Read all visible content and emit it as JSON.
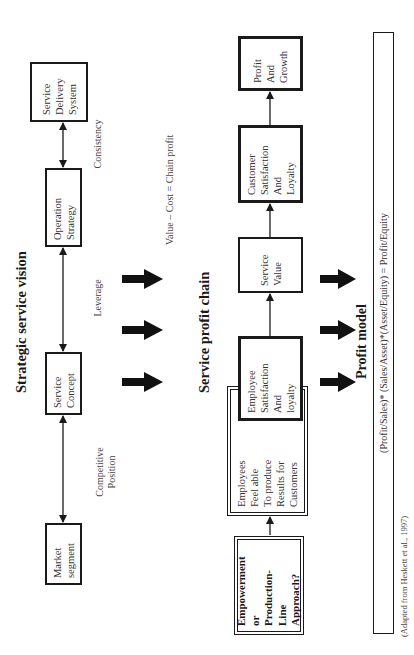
{
  "figure": {
    "strategic_vision": {
      "title": "Strategic service vision",
      "boxes": [
        {
          "lines": [
            "Market",
            "segment"
          ]
        },
        {
          "lines": [
            "Service",
            "Concept"
          ]
        },
        {
          "lines": [
            "Operation",
            "Strategy"
          ]
        },
        {
          "lines": [
            "Service",
            "Delivery",
            "System"
          ]
        }
      ],
      "link_labels": {
        "competitive": [
          "Competitive",
          "Position"
        ],
        "leverage": "Leverage",
        "consistency": "Consistency"
      }
    },
    "value_equation": "Value – Cost = Chain profit",
    "profit_chain": {
      "title": "Service profit chain",
      "boxes": [
        {
          "lines": [
            "Empowerment",
            "or",
            "Production-",
            "Line",
            "Approach?"
          ]
        },
        {
          "lines": [
            "Employees",
            "Feel able",
            "To produce",
            "Results for",
            "Customers"
          ]
        },
        {
          "lines": [
            "Employee",
            "Satisfaction",
            "And",
            "loyalty"
          ]
        },
        {
          "lines": [
            "Service",
            "Value"
          ]
        },
        {
          "lines": [
            "Customer",
            "Satisfaction",
            "And",
            "Loyalty"
          ]
        },
        {
          "lines": [
            "Profit",
            "And",
            "Growth"
          ]
        }
      ]
    },
    "profit_model": {
      "title": "Profit model",
      "formula": "(Profit/Sales)* (Sales/Asset)*(Asset/Equity) = Profit/Equity"
    },
    "citation": "(Adapted from Heskett et al., 1997)"
  }
}
